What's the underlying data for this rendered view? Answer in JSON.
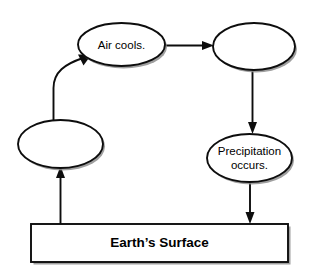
{
  "diagram": {
    "type": "cycle-flowchart",
    "background_color": "#ffffff",
    "stroke_color": "#0d0d0d",
    "fill_color": "#ffffff",
    "shadow_color": "#8e8e8e",
    "nodes": [
      {
        "id": "evaporation-blank",
        "shape": "ellipse",
        "label": "",
        "cx": 60.5,
        "cy": 144,
        "rx": 42.5,
        "ry": 24
      },
      {
        "id": "air-cools",
        "shape": "ellipse",
        "label": "Air cools.",
        "cx": 121.5,
        "cy": 44.5,
        "rx": 43.5,
        "ry": 21.5
      },
      {
        "id": "condensation-blank",
        "shape": "ellipse",
        "label": "",
        "cx": 254,
        "cy": 46.5,
        "rx": 41,
        "ry": 23.5
      },
      {
        "id": "precipitation-occurs",
        "shape": "ellipse",
        "label_line_1": "Precipitation",
        "label_line_2": "occurs.",
        "cx": 249.5,
        "cy": 158,
        "rx": 42.5,
        "ry": 24
      },
      {
        "id": "earths-surface",
        "shape": "rectangle",
        "label": "Earth’s Surface",
        "x": 31,
        "y": 224,
        "width": 257,
        "height": 38
      }
    ],
    "connectors": [
      {
        "id": "surface-to-evaporation",
        "from": "earths-surface",
        "to": "evaporation-blank",
        "style": "straight-vertical",
        "direction": "up"
      },
      {
        "id": "evaporation-to-air-cools",
        "from": "evaporation-blank",
        "to": "air-cools",
        "style": "curved",
        "direction": "up-right"
      },
      {
        "id": "air-cools-to-condensation",
        "from": "air-cools",
        "to": "condensation-blank",
        "style": "straight-horizontal",
        "direction": "right"
      },
      {
        "id": "condensation-to-precipitation",
        "from": "condensation-blank",
        "to": "precipitation-occurs",
        "style": "straight-vertical",
        "direction": "down"
      },
      {
        "id": "precipitation-to-surface",
        "from": "precipitation-occurs",
        "to": "earths-surface",
        "style": "straight-vertical",
        "direction": "down"
      }
    ]
  }
}
